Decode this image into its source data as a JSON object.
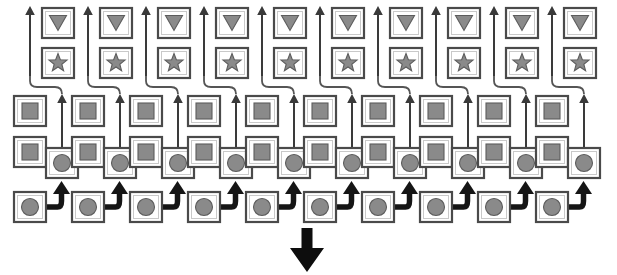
{
  "diagram": {
    "type": "node-lattice",
    "canvas": {
      "width": 617,
      "height": 275
    },
    "colors": {
      "background": "#ffffff",
      "box_stroke": "#4a4a4a",
      "box_fill": "#ffffff",
      "glyph_fill": "#8a8a8a",
      "glyph_stroke": "#5c5c5c",
      "thin_arrow": "#3a3a3a",
      "elbow_connector": "#555555",
      "thick_arrow": "#151515",
      "big_arrow": "#0d0d0d"
    },
    "column_count": 10,
    "column_pitch": 58,
    "box_size": {
      "width": 32,
      "height": 30
    },
    "rows": [
      {
        "id": "row-triangle",
        "glyph": "triangle-down-icon",
        "glyph_label": "triangle-down",
        "y": 8,
        "x_start": 42,
        "count": 10
      },
      {
        "id": "row-star",
        "glyph": "star-icon",
        "glyph_label": "star",
        "y": 48,
        "x_start": 42,
        "count": 10
      },
      {
        "id": "row-square-upper",
        "glyph": "square-icon",
        "glyph_label": "square",
        "y": 96,
        "x_start": 14,
        "count": 10
      },
      {
        "id": "row-square-lower",
        "glyph": "square-icon",
        "glyph_label": "square",
        "y": 137,
        "x_start": 14,
        "count": 10
      },
      {
        "id": "row-circle-mid",
        "glyph": "circle-icon",
        "glyph_label": "circle",
        "y": 148,
        "x_start": 46,
        "count": 10
      },
      {
        "id": "row-circle-bottom",
        "glyph": "circle-icon",
        "glyph_label": "circle",
        "y": 192,
        "x_start": 14,
        "count": 10
      }
    ],
    "connectors": {
      "thin_vertical_label": "thin-up-arrow",
      "elbow_label": "curved-elbow-connector",
      "thick_elbow_label": "thick-elbow-up-arrow",
      "output_label": "large-down-arrow"
    },
    "output_arrow": {
      "name": "large-down-arrow",
      "x": 307,
      "y_top": 228,
      "y_bottom": 272
    }
  }
}
